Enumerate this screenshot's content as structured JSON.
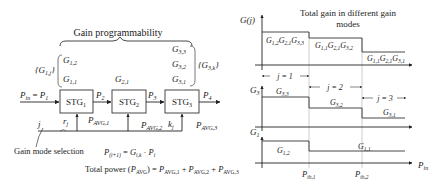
{
  "left_diagram": {
    "title": "Gain programmability",
    "stage1_set_label": "{G",
    "stage1_set": [
      "G1,2",
      "G1,1"
    ],
    "stage2_set": [
      "G2,1"
    ],
    "stage3_set": [
      "G3,3",
      "G3,2",
      "G3,1"
    ],
    "set_labels": {
      "left": "{G1,j}",
      "right": "{G3,k}"
    },
    "stages": [
      "STG1",
      "STG2",
      "STG3"
    ],
    "signals": {
      "input": "Pin = P1",
      "p2": "P2",
      "p3": "P3",
      "p4": "P4"
    },
    "avg_power_labels": [
      "PAVG,1",
      "PAVG,2",
      "PAVG,3"
    ],
    "control_labels": {
      "j": "j",
      "r": "rj",
      "k": "kj"
    },
    "annotation": "Gain mode selection",
    "formula_1": "P(i+1) = Gi,k · Pi",
    "formula_2": "Total power (PAVG) = PAVG,1 + PAVG,2 + PAVG,3"
  },
  "right_diagram": {
    "title_line1": "Total gain in different gain",
    "title_line2": "modes",
    "top_axis_label": "G(j)",
    "total_gain_levels": [
      "G1,2G2,1G3,3",
      "G1,1G2,1G3,2",
      "G1,1G2,1G3,1"
    ],
    "mode_labels": [
      "j = 1",
      "j = 2",
      "j = 3"
    ],
    "g3_axis_label": "G3",
    "g3_levels": [
      "G3,3",
      "G3,2",
      "G3,1"
    ],
    "g1_axis_label": "G1",
    "g1_levels": [
      "G1,2",
      "G1,1"
    ],
    "x_axis_label": "Pin",
    "thresholds": [
      "Pth,1",
      "Pth,2"
    ]
  }
}
